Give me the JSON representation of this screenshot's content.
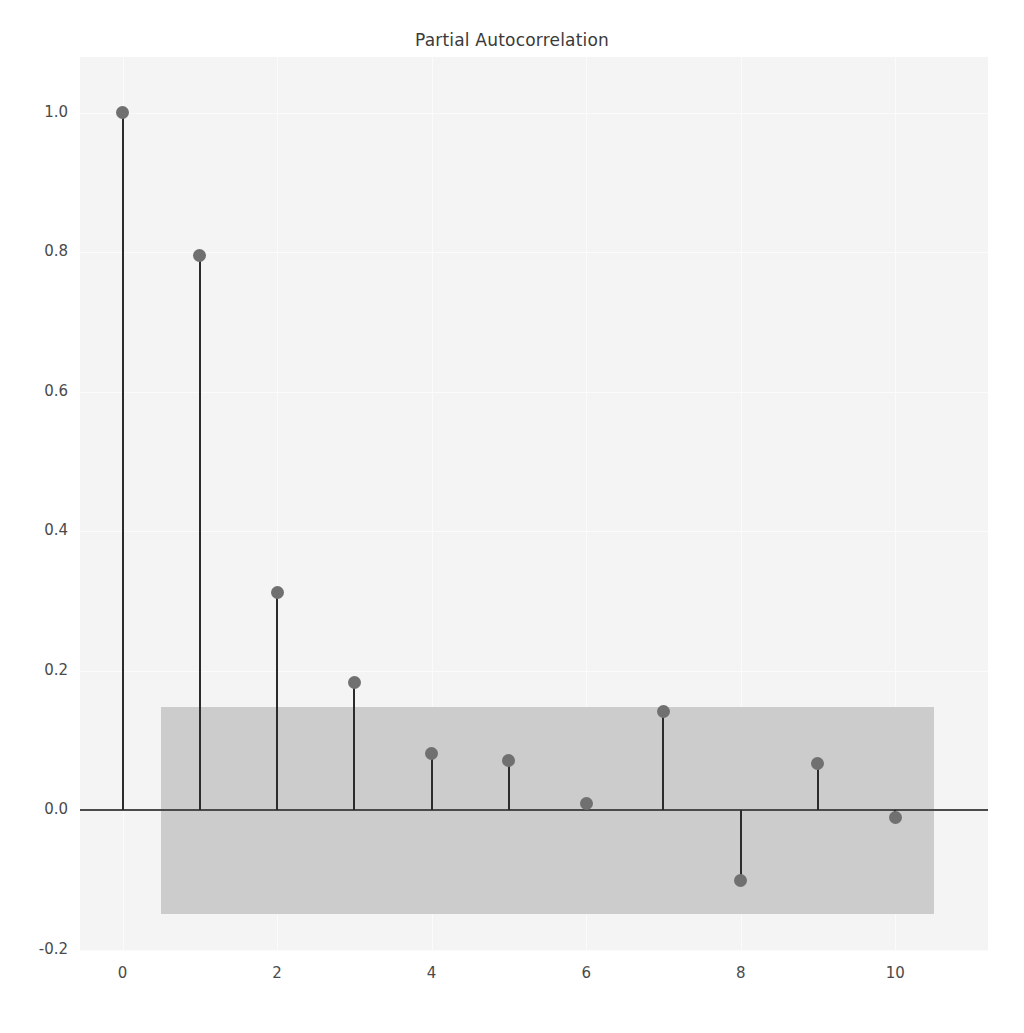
{
  "chart_data": {
    "type": "scatter",
    "title": "Partial Autocorrelation",
    "xlabel": "",
    "ylabel": "",
    "x": [
      0,
      1,
      2,
      3,
      4,
      5,
      6,
      7,
      8,
      9,
      10
    ],
    "values": [
      1.0,
      0.796,
      0.312,
      0.184,
      0.082,
      0.071,
      0.01,
      0.142,
      -0.101,
      0.067,
      -0.01
    ],
    "series": [
      {
        "name": "Partial autocorrelation",
        "values": [
          1.0,
          0.796,
          0.312,
          0.184,
          0.082,
          0.071,
          0.01,
          0.142,
          -0.101,
          0.067,
          -0.01
        ]
      }
    ],
    "confidence_band": {
      "upper": 0.149,
      "lower": -0.149,
      "x_start": 0.5,
      "x_end": 10.5,
      "color": "#c9c9c9"
    },
    "xlim": [
      -0.55,
      11.2
    ],
    "ylim": [
      -0.2,
      1.08
    ],
    "xticks": [
      0,
      2,
      4,
      6,
      8,
      10
    ],
    "xtick_labels": [
      "0",
      "2",
      "4",
      "6",
      "8",
      "10"
    ],
    "yticks": [
      -0.2,
      0.0,
      0.2,
      0.4,
      0.6,
      0.8,
      1.0
    ],
    "ytick_labels": [
      "-0.2",
      "0.0",
      "0.2",
      "0.4",
      "0.6",
      "0.8",
      "1.0"
    ],
    "grid": true,
    "legend": null,
    "marker_color": "#707070",
    "stem_color": "#2b2b2b",
    "plot_background": "#f4f4f4"
  }
}
